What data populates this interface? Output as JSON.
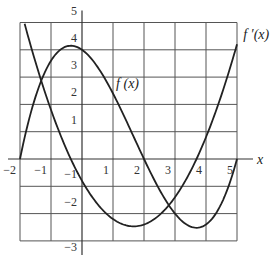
{
  "chart_data": {
    "type": "line",
    "title": "",
    "xlabel": "x",
    "ylabel": "",
    "xlim": [
      -2,
      5
    ],
    "ylim": [
      -3,
      5
    ],
    "grid": true,
    "x_ticks": [
      {
        "value": -2,
        "label": "−2"
      },
      {
        "value": -1,
        "label": "−1"
      },
      {
        "value": 1,
        "label": "1"
      },
      {
        "value": 2,
        "label": "2"
      },
      {
        "value": 3,
        "label": "3"
      },
      {
        "value": 4,
        "label": "4"
      },
      {
        "value": 5,
        "label": "5"
      }
    ],
    "y_ticks": [
      {
        "value": 5,
        "label": "5"
      },
      {
        "value": 4,
        "label": "4"
      },
      {
        "value": 3,
        "label": "3"
      },
      {
        "value": 2,
        "label": "2"
      },
      {
        "value": 1,
        "label": "1"
      },
      {
        "value": -1,
        "label": "−1"
      },
      {
        "value": -2,
        "label": "−2"
      },
      {
        "value": -3,
        "label": "−3"
      }
    ],
    "series": [
      {
        "name": "f(x)",
        "label": "f (x)",
        "formula": "0.2(x+2)(x-2)(x-5)",
        "coeffs": [
          0.2,
          -1.0,
          -0.8,
          4.0
        ],
        "x_range": [
          -2,
          5
        ],
        "key_points": {
          "zeros": [
            -2,
            2,
            5
          ],
          "local_max": [
            -0.33,
            4.15
          ],
          "local_min": [
            4.0,
            -2.4
          ]
        }
      },
      {
        "name": "f'(x)",
        "label": "f ′(x)",
        "formula": "0.6x^2 - 2x - 0.8",
        "coeffs": [
          0,
          0.6,
          -2.0,
          -0.8
        ],
        "x_range": [
          -1.85,
          5
        ],
        "key_points": {
          "zeros": [
            -0.36,
            3.69
          ],
          "local_min": [
            1.67,
            -2.47
          ]
        }
      }
    ],
    "annotations": [
      {
        "text": "f (x)",
        "x": 1.1,
        "y": 2.6
      },
      {
        "text": "f ′(x)",
        "x": 5.2,
        "y": 4.4
      }
    ]
  }
}
